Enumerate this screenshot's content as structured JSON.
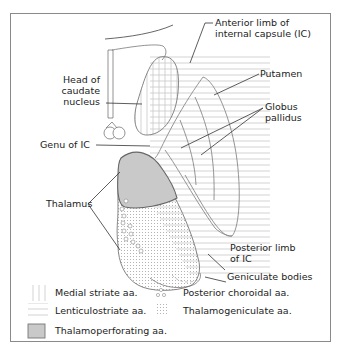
{
  "diagram": {
    "type": "anatomical-section",
    "labels": {
      "anterior_limb_line1": "Anterior limb of",
      "anterior_limb_line2": "internal capsule (IC)",
      "putamen": "Putamen",
      "globus_line1": "Globus",
      "globus_line2": "pallidus",
      "head_line1": "Head of",
      "head_line2": "caudate",
      "head_line3": "nucleus",
      "genu": "Genu of IC",
      "thalamus": "Thalamus",
      "posterior_line1": "Posterior limb",
      "posterior_line2": "of IC",
      "geniculate": "Geniculate bodies"
    },
    "legend": [
      {
        "pattern": "vertical-lines",
        "label": "Medial striate aa."
      },
      {
        "pattern": "small-circles",
        "label": "Posterior choroidal aa."
      },
      {
        "pattern": "horizontal-lines",
        "label": "Lenticulostriate aa."
      },
      {
        "pattern": "dots",
        "label": "Thalamogeniculate aa."
      },
      {
        "pattern": "solid-gray",
        "label": "Thalamoperforating aa."
      }
    ],
    "colors": {
      "outline": "#7a7a7a",
      "hatch": "#c8c8c8",
      "thalamoperforating_fill": "#c9c9c9",
      "text": "#222222"
    }
  }
}
